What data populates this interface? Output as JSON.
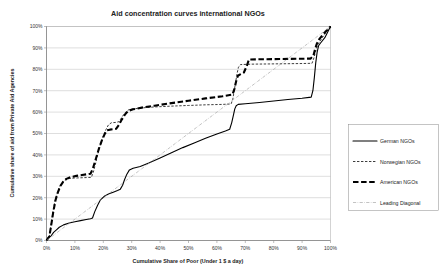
{
  "chart_data": {
    "type": "line",
    "title": "Aid concentration curves international NGOs",
    "xlabel": "Cumulative Share of Poor (Under 1 $ a day)",
    "ylabel": "Cumulative share of aid from Private Aid Agencies",
    "xlim": [
      0,
      100
    ],
    "ylim": [
      0,
      100
    ],
    "xticks": [
      0,
      10,
      20,
      30,
      40,
      50,
      60,
      70,
      80,
      90,
      100
    ],
    "xticklabels": [
      "0%",
      "10%",
      "20%",
      "30%",
      "40%",
      "50%",
      "60%",
      "70%",
      "80%",
      "90%",
      "100%"
    ],
    "yticks": [
      0,
      10,
      20,
      30,
      40,
      50,
      60,
      70,
      80,
      90,
      100
    ],
    "yticklabels": [
      "0%",
      "10%",
      "20%",
      "30%",
      "40%",
      "50%",
      "60%",
      "70%",
      "80%",
      "90%",
      "100%"
    ],
    "grid": "horizontal",
    "legend_position": "right-outside",
    "series": [
      {
        "name": "German NGOs",
        "style": "solid",
        "color": "#000000",
        "points": [
          [
            0,
            0
          ],
          [
            0.6,
            1.5
          ],
          [
            1.5,
            2.0
          ],
          [
            2.5,
            3.8
          ],
          [
            3.5,
            5.0
          ],
          [
            4.5,
            6.2
          ],
          [
            6.0,
            7.3
          ],
          [
            8.0,
            8.2
          ],
          [
            10.0,
            8.8
          ],
          [
            12.0,
            9.3
          ],
          [
            14.0,
            9.8
          ],
          [
            15.5,
            10.2
          ],
          [
            16.2,
            10.5
          ],
          [
            17.0,
            13.5
          ],
          [
            18.0,
            16.5
          ],
          [
            19.0,
            19.0
          ],
          [
            20.5,
            20.8
          ],
          [
            22.0,
            21.8
          ],
          [
            23.5,
            22.6
          ],
          [
            25.0,
            23.4
          ],
          [
            26.0,
            24.0
          ],
          [
            26.8,
            25.8
          ],
          [
            27.5,
            28.5
          ],
          [
            28.3,
            31.0
          ],
          [
            29.2,
            33.0
          ],
          [
            30.5,
            33.8
          ],
          [
            33.0,
            34.6
          ],
          [
            36.0,
            36.2
          ],
          [
            40.0,
            38.6
          ],
          [
            44.0,
            41.0
          ],
          [
            48.0,
            43.4
          ],
          [
            52.0,
            45.6
          ],
          [
            56.0,
            47.8
          ],
          [
            60.0,
            49.8
          ],
          [
            63.0,
            51.2
          ],
          [
            64.5,
            52.0
          ],
          [
            65.2,
            55.0
          ],
          [
            65.8,
            58.5
          ],
          [
            66.3,
            61.5
          ],
          [
            66.8,
            63.0
          ],
          [
            67.5,
            63.6
          ],
          [
            70.0,
            63.9
          ],
          [
            75.0,
            64.5
          ],
          [
            80.0,
            65.2
          ],
          [
            85.0,
            65.9
          ],
          [
            90.0,
            66.5
          ],
          [
            92.5,
            66.9
          ],
          [
            93.2,
            67.0
          ],
          [
            93.8,
            70.0
          ],
          [
            94.3,
            76.0
          ],
          [
            94.8,
            83.0
          ],
          [
            95.3,
            88.0
          ],
          [
            95.8,
            91.0
          ],
          [
            96.5,
            92.3
          ],
          [
            98.0,
            94.8
          ],
          [
            100,
            100
          ]
        ]
      },
      {
        "name": "Norwegian NGOs",
        "style": "dashed-thin",
        "color": "#1a1a1a",
        "points": [
          [
            0,
            0
          ],
          [
            1.0,
            2.0
          ],
          [
            1.6,
            7.0
          ],
          [
            2.2,
            13.0
          ],
          [
            3.0,
            18.5
          ],
          [
            3.8,
            22.0
          ],
          [
            4.6,
            25.0
          ],
          [
            5.6,
            27.0
          ],
          [
            6.6,
            28.2
          ],
          [
            8.0,
            29.0
          ],
          [
            10.0,
            29.2
          ],
          [
            12.0,
            29.3
          ],
          [
            14.0,
            29.4
          ],
          [
            15.8,
            29.5
          ],
          [
            16.5,
            32.0
          ],
          [
            17.2,
            35.5
          ],
          [
            17.9,
            39.5
          ],
          [
            18.6,
            43.0
          ],
          [
            19.4,
            46.5
          ],
          [
            20.2,
            49.5
          ],
          [
            21.0,
            52.0
          ],
          [
            21.8,
            54.0
          ],
          [
            22.8,
            55.0
          ],
          [
            24.5,
            55.2
          ],
          [
            25.5,
            55.5
          ],
          [
            26.5,
            57.5
          ],
          [
            27.5,
            59.5
          ],
          [
            28.8,
            61.0
          ],
          [
            30.5,
            61.5
          ],
          [
            34.0,
            62.0
          ],
          [
            38.0,
            62.4
          ],
          [
            44.0,
            62.8
          ],
          [
            50.0,
            63.1
          ],
          [
            56.0,
            63.4
          ],
          [
            62.0,
            63.6
          ],
          [
            65.0,
            63.8
          ],
          [
            65.6,
            66.0
          ],
          [
            66.1,
            70.0
          ],
          [
            66.6,
            74.0
          ],
          [
            67.1,
            78.0
          ],
          [
            67.6,
            81.0
          ],
          [
            68.3,
            82.2
          ],
          [
            72.0,
            82.4
          ],
          [
            78.0,
            82.5
          ],
          [
            84.0,
            82.6
          ],
          [
            90.0,
            82.7
          ],
          [
            93.5,
            82.8
          ],
          [
            94.2,
            85.5
          ],
          [
            94.8,
            88.5
          ],
          [
            95.4,
            91.0
          ],
          [
            96.2,
            93.0
          ],
          [
            97.5,
            95.5
          ],
          [
            100,
            100
          ]
        ]
      },
      {
        "name": "American NGOs",
        "style": "dashed-thick",
        "color": "#000000",
        "points": [
          [
            0,
            0
          ],
          [
            1.0,
            1.8
          ],
          [
            1.7,
            7.5
          ],
          [
            2.4,
            13.5
          ],
          [
            3.2,
            19.0
          ],
          [
            4.0,
            22.5
          ],
          [
            4.9,
            25.5
          ],
          [
            5.9,
            27.5
          ],
          [
            7.0,
            28.8
          ],
          [
            8.5,
            29.6
          ],
          [
            10.5,
            30.2
          ],
          [
            12.5,
            30.6
          ],
          [
            14.0,
            30.9
          ],
          [
            15.5,
            31.2
          ],
          [
            16.3,
            33.5
          ],
          [
            17.0,
            36.5
          ],
          [
            17.8,
            40.0
          ],
          [
            18.6,
            43.5
          ],
          [
            19.5,
            46.8
          ],
          [
            20.4,
            49.5
          ],
          [
            21.3,
            51.5
          ],
          [
            22.3,
            51.8
          ],
          [
            23.5,
            52.0
          ],
          [
            24.5,
            52.2
          ],
          [
            25.5,
            54.0
          ],
          [
            26.5,
            56.5
          ],
          [
            27.6,
            58.8
          ],
          [
            28.8,
            60.6
          ],
          [
            30.5,
            61.3
          ],
          [
            34.0,
            62.2
          ],
          [
            38.0,
            63.0
          ],
          [
            44.0,
            64.2
          ],
          [
            50.0,
            65.3
          ],
          [
            56.0,
            66.4
          ],
          [
            62.0,
            67.4
          ],
          [
            65.5,
            68.2
          ],
          [
            66.2,
            71.0
          ],
          [
            66.8,
            74.5
          ],
          [
            67.4,
            77.0
          ],
          [
            68.2,
            77.6
          ],
          [
            69.5,
            78.5
          ],
          [
            70.5,
            81.5
          ],
          [
            71.3,
            84.6
          ],
          [
            76.0,
            84.7
          ],
          [
            82.0,
            84.8
          ],
          [
            88.0,
            84.9
          ],
          [
            93.0,
            85.0
          ],
          [
            94.0,
            86.5
          ],
          [
            94.6,
            89.5
          ],
          [
            95.2,
            92.0
          ],
          [
            96.0,
            94.0
          ],
          [
            97.5,
            96.5
          ],
          [
            100,
            100
          ]
        ]
      },
      {
        "name": "Leading Diagonal",
        "style": "dash-dot",
        "color": "#9a9a9a",
        "points": [
          [
            0,
            0
          ],
          [
            100,
            100
          ]
        ]
      }
    ]
  },
  "legend": {
    "items": [
      {
        "label": "German NGOs",
        "style": "solid"
      },
      {
        "label": "Norwegian NGOs",
        "style": "dashed-thin"
      },
      {
        "label": "American NGOs",
        "style": "dashed-thick"
      },
      {
        "label": "Leading Diagonal",
        "style": "dash-dot"
      }
    ]
  }
}
